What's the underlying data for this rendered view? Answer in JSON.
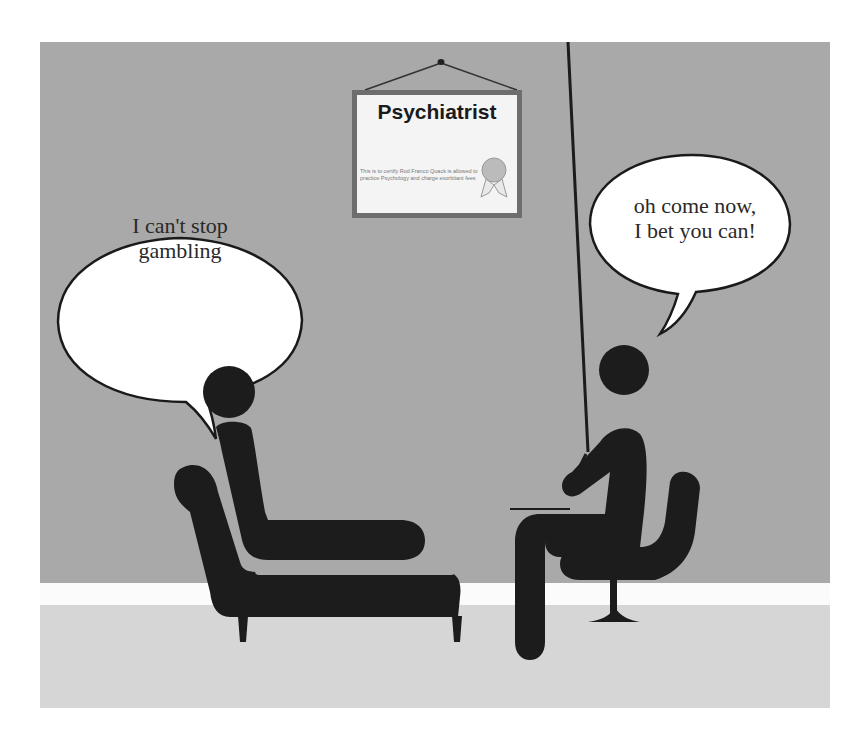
{
  "scene": {
    "description": "Cartoon of a patient on a couch talking to a psychiatrist",
    "colors": {
      "wall": "#a9a9a9",
      "baseboard": "#fbfbfb",
      "floor": "#d6d6d6",
      "figures": "#1c1c1c",
      "bubble_fill": "#ffffff",
      "bubble_stroke": "#1a1a1a"
    }
  },
  "certificate": {
    "title": "Psychiatrist",
    "body": "This is to certify Rod Franco Quack is allowed to practice Psychology and charge exorbitant fees",
    "seal_icon": "rosette-ribbon"
  },
  "speech": {
    "patient": {
      "line1": "I can't stop",
      "line2": "gambling"
    },
    "psychiatrist": {
      "line1": "oh come now,",
      "line2": "I bet you can!"
    }
  }
}
